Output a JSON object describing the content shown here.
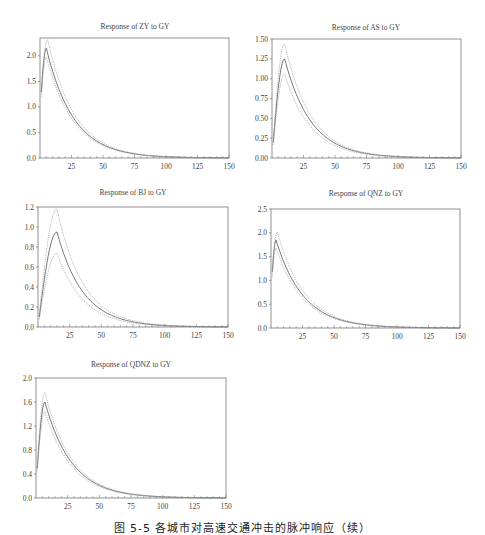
{
  "figure": {
    "caption": "图 5-5  各城市对高速交通冲击的脉冲响应（续）"
  },
  "chart_data": [
    {
      "type": "line",
      "title": "Response of ZY to GY",
      "xlabel": "",
      "ylabel": "",
      "xlim": [
        0,
        150
      ],
      "ylim": [
        0,
        2.35
      ],
      "xticks": [
        25,
        50,
        75,
        100,
        125,
        150
      ],
      "yticks": [
        0.0,
        0.5,
        1.0,
        1.5,
        2.0
      ],
      "ytick_labels": [
        "0.0",
        "0.5",
        "1.0",
        "1.5",
        "2.0"
      ],
      "grid": false,
      "series": [
        {
          "name": "response",
          "style": "solid",
          "peak": 2.15,
          "peak_x": 5
        },
        {
          "name": "upper band",
          "style": "dotted",
          "peak": 2.32,
          "peak_x": 6
        },
        {
          "name": "lower band",
          "style": "dotted",
          "peak": 1.98,
          "peak_x": 5
        }
      ],
      "x": [
        1,
        5,
        10,
        25,
        50,
        75,
        100,
        125,
        150
      ],
      "values": [
        1.0,
        2.15,
        1.95,
        1.2,
        0.45,
        0.16,
        0.06,
        0.02,
        0.0
      ]
    },
    {
      "type": "line",
      "title": "Response of AS to GY",
      "xlim": [
        0,
        150
      ],
      "ylim": [
        0,
        1.5
      ],
      "xticks": [
        25,
        50,
        75,
        100,
        125,
        150
      ],
      "yticks": [
        0.0,
        0.25,
        0.5,
        0.75,
        1.0,
        1.25,
        1.5
      ],
      "ytick_labels": [
        "0.00",
        "0.25",
        "0.50",
        "0.75",
        "1.00",
        "1.25",
        "1.50"
      ],
      "grid": false,
      "series": [
        {
          "name": "response",
          "style": "solid",
          "peak": 1.25,
          "peak_x": 10
        },
        {
          "name": "upper band",
          "style": "dotted",
          "peak": 1.44,
          "peak_x": 10
        },
        {
          "name": "lower band",
          "style": "dotted",
          "peak": 1.06,
          "peak_x": 10
        }
      ],
      "x": [
        1,
        10,
        25,
        50,
        75,
        100,
        125,
        150
      ],
      "values": [
        0.0,
        1.25,
        0.85,
        0.3,
        0.1,
        0.03,
        0.01,
        0.0
      ]
    },
    {
      "type": "line",
      "title": "Response of BJ to GY",
      "xlim": [
        0,
        150
      ],
      "ylim": [
        0,
        1.2
      ],
      "xticks": [
        25,
        50,
        75,
        100,
        125,
        150
      ],
      "yticks": [
        0.0,
        0.2,
        0.4,
        0.6,
        0.8,
        1.0,
        1.2
      ],
      "ytick_labels": [
        "0.0",
        "0.2",
        "0.4",
        "0.6",
        "0.8",
        "1.0",
        "1.2"
      ],
      "grid": false,
      "series": [
        {
          "name": "response",
          "style": "solid",
          "peak": 0.95,
          "peak_x": 15
        },
        {
          "name": "upper band",
          "style": "dotted",
          "peak": 1.18,
          "peak_x": 15
        },
        {
          "name": "lower band",
          "style": "dotted",
          "peak": 0.74,
          "peak_x": 15
        }
      ],
      "x": [
        1,
        15,
        25,
        50,
        75,
        100,
        125,
        150
      ],
      "values": [
        0.0,
        0.95,
        0.82,
        0.38,
        0.13,
        0.04,
        0.01,
        0.0
      ]
    },
    {
      "type": "line",
      "title": "Response of QNZ to GY",
      "xlim": [
        0,
        150
      ],
      "ylim": [
        0,
        2.5
      ],
      "xticks": [
        25,
        50,
        75,
        100,
        125,
        150
      ],
      "yticks": [
        0.0,
        0.5,
        1.0,
        1.5,
        2.0,
        2.5
      ],
      "ytick_labels": [
        "0.0",
        "0.5",
        "1.0",
        "1.5",
        "2.0",
        "2.5"
      ],
      "grid": false,
      "series": [
        {
          "name": "response",
          "style": "solid",
          "peak": 1.85,
          "peak_x": 4
        },
        {
          "name": "upper band",
          "style": "dotted",
          "peak": 2.02,
          "peak_x": 5
        },
        {
          "name": "lower band",
          "style": "dotted",
          "peak": 1.68,
          "peak_x": 4
        }
      ],
      "x": [
        1,
        4,
        10,
        25,
        50,
        75,
        100,
        125,
        150
      ],
      "values": [
        0.85,
        1.85,
        1.6,
        1.0,
        0.35,
        0.12,
        0.04,
        0.01,
        0.0
      ]
    },
    {
      "type": "line",
      "title": "Response of QDNZ to GY",
      "xlim": [
        0,
        150
      ],
      "ylim": [
        0,
        2.0
      ],
      "xticks": [
        25,
        50,
        75,
        100,
        125,
        150
      ],
      "yticks": [
        0.0,
        0.4,
        0.8,
        1.2,
        1.6,
        2.0
      ],
      "ytick_labels": [
        "0.0",
        "0.4",
        "0.8",
        "1.2",
        "1.6",
        "2.0"
      ],
      "grid": false,
      "series": [
        {
          "name": "response",
          "style": "solid",
          "peak": 1.6,
          "peak_x": 7
        },
        {
          "name": "upper band",
          "style": "dotted",
          "peak": 1.76,
          "peak_x": 7
        },
        {
          "name": "lower band",
          "style": "dotted",
          "peak": 1.44,
          "peak_x": 7
        }
      ],
      "x": [
        1,
        7,
        25,
        50,
        75,
        100,
        125,
        150
      ],
      "values": [
        0.2,
        1.6,
        1.0,
        0.38,
        0.14,
        0.05,
        0.02,
        0.0
      ]
    }
  ]
}
